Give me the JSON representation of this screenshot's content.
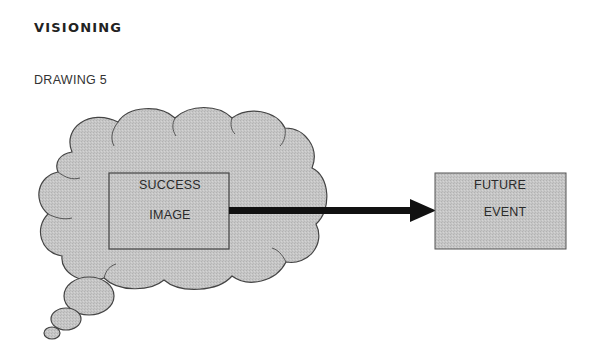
{
  "header": {
    "title": "VISIONING",
    "subtitle": "DRAWING 5"
  },
  "diagram": {
    "thought_cloud": {
      "box": {
        "line1": "SUCCESS",
        "line2": "IMAGE"
      }
    },
    "target_box": {
      "line1": "FUTURE",
      "line2": "EVENT"
    },
    "arrow": {
      "from": "success-image",
      "to": "future-event"
    },
    "colors": {
      "fill": "#c4c4c4",
      "stroke": "#3a3a3a",
      "arrow": "#111111",
      "background": "#ffffff"
    }
  }
}
